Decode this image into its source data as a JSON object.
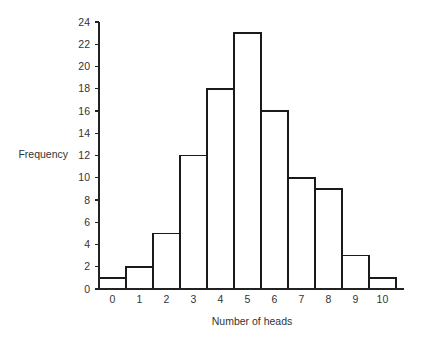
{
  "chart_data": {
    "type": "bar",
    "title": "",
    "subtitle": "",
    "xlabel": "Number of heads",
    "ylabel": "Frequency",
    "categories": [
      "0",
      "1",
      "2",
      "3",
      "4",
      "5",
      "6",
      "7",
      "8",
      "9",
      "10"
    ],
    "values": [
      1,
      2,
      5,
      12,
      18,
      23,
      16,
      10,
      9,
      3,
      1
    ],
    "series": [
      {
        "name": "Frequency",
        "values": [
          1,
          2,
          5,
          12,
          18,
          23,
          16,
          10,
          9,
          3,
          1
        ]
      }
    ],
    "xlim": [
      -0.5,
      10.8
    ],
    "ylim": [
      0,
      24
    ],
    "ytick_labels": [
      "0",
      "2",
      "4",
      "6",
      "8",
      "10",
      "12",
      "14",
      "16",
      "18",
      "20",
      "22",
      "24"
    ],
    "ytick_values": [
      0,
      2,
      4,
      6,
      8,
      10,
      12,
      14,
      16,
      18,
      20,
      22,
      24
    ],
    "xtick_labels": [
      "0",
      "1",
      "2",
      "3",
      "4",
      "5",
      "6",
      "7",
      "8",
      "9",
      "10"
    ],
    "xtick_values": [
      0,
      1,
      2,
      3,
      4,
      5,
      6,
      7,
      8,
      9,
      10
    ],
    "grid": false,
    "legend": false,
    "legend_position": "none",
    "bar_fill_color": "#ffffff",
    "bar_edge_color": "#1a1a1a",
    "axis_color": "#222222",
    "background_color": "#ffffff",
    "annotations": []
  }
}
